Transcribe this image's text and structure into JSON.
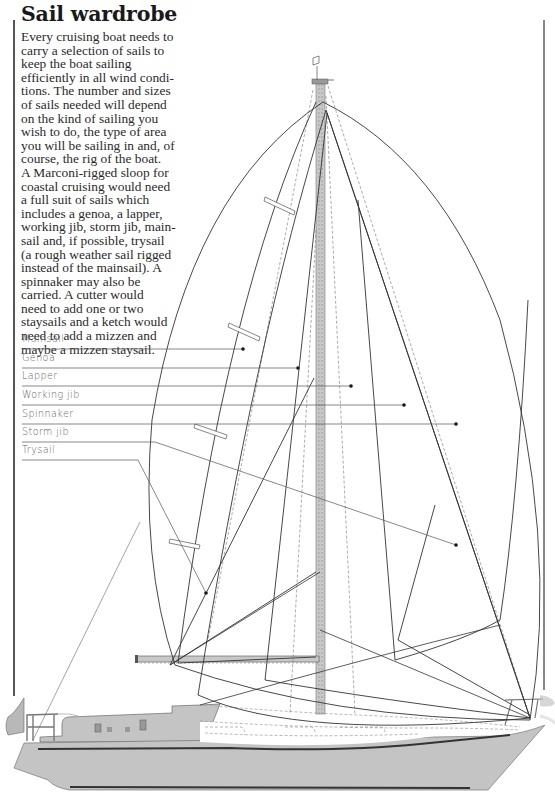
{
  "page": {
    "title": "Sail wardrobe",
    "intro_lines": [
      "Every cruising boat needs to",
      "carry a selection of sails to",
      "keep the boat sailing",
      "efficiently in all wind condi-",
      "tions. The number and sizes",
      "of sails needed will depend",
      "on the kind of sailing you",
      "wish to do, the type of area",
      "you will be sailing in and, of",
      "course, the rig of the boat.",
      "A Marconi-rigged sloop for",
      "coastal cruising would need",
      "a full suit of sails which",
      "includes a genoa, a lapper,",
      "working jib, storm jib, main-",
      "sail and, if possible, trysail",
      "(a rough weather sail rigged",
      "instead of the mainsail). A",
      "spinnaker may also be",
      "carried. A cutter would",
      "need to add one or two",
      "staysails and a ketch would",
      "need to add a mizzen and",
      "maybe a mizzen staysail."
    ]
  },
  "diagram": {
    "legend": [
      {
        "label": "Mainsail",
        "line_y": 349,
        "pointer_end": [
          243,
          349
        ]
      },
      {
        "label": "Genoa",
        "line_y": 368,
        "pointer_end": [
          298,
          368
        ]
      },
      {
        "label": "Lapper",
        "line_y": 386,
        "pointer_end": [
          351,
          386
        ]
      },
      {
        "label": "Working jib",
        "line_y": 405,
        "pointer_end": [
          404,
          405
        ]
      },
      {
        "label": "Spinnaker",
        "line_y": 424,
        "pointer_end": [
          456,
          424
        ]
      },
      {
        "label": "Storm jib",
        "line_y": 442,
        "pointer_end": [
          456,
          545
        ]
      },
      {
        "label": "Trysail",
        "line_y": 460,
        "pointer_end": [
          206,
          593
        ]
      }
    ],
    "colors": {
      "text": "#2a2a2a",
      "label_text": "#666666",
      "sail_line": "#333333",
      "mast_fill": "#c8c8c8",
      "hull_fill": "#c4c4c4",
      "hull_dark": "#3a3a3a",
      "dashed": "#888888"
    }
  }
}
